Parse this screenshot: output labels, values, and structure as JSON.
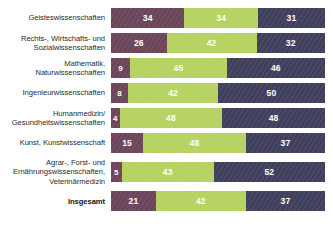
{
  "chart_data": {
    "type": "bar",
    "subtype": "stacked-horizontal-100pct",
    "title": "",
    "subtitle": "",
    "xlabel": "",
    "ylabel": "",
    "xlim": [
      0,
      100
    ],
    "grid": false,
    "legend_position": "none",
    "value_unit": "%",
    "categories": [
      "Geisteswissenschaften",
      "Rechts-, Wirtschafts- und\nSozialwissenschaften",
      "Mathematik,\nNaturwissenschaften",
      "Ingenieurwissenschaften",
      "Humanmedizin/\nGesundheitswissenschaften",
      "Kunst, Kunstwissenschaft",
      "Agrar-, Forst- und\nErnährungswissenschaften,\nVeterinärmedizin",
      "Insgesamt"
    ],
    "series": [
      {
        "name": "Segment 1",
        "color": "#6B4459",
        "values": [
          34,
          26,
          9,
          8,
          4,
          15,
          5,
          21
        ]
      },
      {
        "name": "Segment 2",
        "color": "#B5D25F",
        "values": [
          34,
          42,
          45,
          42,
          48,
          48,
          43,
          42
        ]
      },
      {
        "name": "Segment 3",
        "color": "#3E3E5C",
        "values": [
          31,
          32,
          46,
          50,
          48,
          37,
          52,
          37
        ]
      }
    ],
    "rows": [
      {
        "label": "Geisteswissenschaften",
        "total": false,
        "segments": [
          {
            "value": 34,
            "label": "34",
            "color": "#6B4459"
          },
          {
            "value": 34,
            "label": "34",
            "color": "#B5D25F"
          },
          {
            "value": 31,
            "label": "31",
            "color": "#3E3E5C"
          }
        ]
      },
      {
        "label": "Rechts-, Wirtschafts- und\nSozialwissenschaften",
        "total": false,
        "segments": [
          {
            "value": 26,
            "label": "26",
            "color": "#6B4459"
          },
          {
            "value": 42,
            "label": "42",
            "color": "#B5D25F"
          },
          {
            "value": 32,
            "label": "32",
            "color": "#3E3E5C"
          }
        ]
      },
      {
        "label": "Mathematik,\nNaturwissenschaften",
        "total": false,
        "segments": [
          {
            "value": 9,
            "label": "9",
            "color": "#6B4459"
          },
          {
            "value": 45,
            "label": "45",
            "color": "#B5D25F"
          },
          {
            "value": 46,
            "label": "46",
            "color": "#3E3E5C"
          }
        ]
      },
      {
        "label": "Ingenieurwissenschaften",
        "total": false,
        "segments": [
          {
            "value": 8,
            "label": "8",
            "color": "#6B4459"
          },
          {
            "value": 42,
            "label": "42",
            "color": "#B5D25F"
          },
          {
            "value": 50,
            "label": "50",
            "color": "#3E3E5C"
          }
        ]
      },
      {
        "label": "Humanmedizin/\nGesundheitswissenschaften",
        "total": false,
        "segments": [
          {
            "value": 4,
            "label": "4",
            "color": "#6B4459"
          },
          {
            "value": 48,
            "label": "48",
            "color": "#B5D25F"
          },
          {
            "value": 48,
            "label": "48",
            "color": "#3E3E5C"
          }
        ]
      },
      {
        "label": "Kunst, Kunstwissenschaft",
        "total": false,
        "segments": [
          {
            "value": 15,
            "label": "15",
            "color": "#6B4459"
          },
          {
            "value": 48,
            "label": "48",
            "color": "#B5D25F"
          },
          {
            "value": 37,
            "label": "37",
            "color": "#3E3E5C"
          }
        ]
      },
      {
        "label": "Agrar-, Forst- und\nErnährungswissenschaften,\nVeterinärmedizin",
        "total": false,
        "segments": [
          {
            "value": 5,
            "label": "5",
            "color": "#6B4459"
          },
          {
            "value": 43,
            "label": "43",
            "color": "#B5D25F"
          },
          {
            "value": 52,
            "label": "52",
            "color": "#3E3E5C"
          }
        ]
      },
      {
        "label": "Insgesamt",
        "total": true,
        "segments": [
          {
            "value": 21,
            "label": "21",
            "color": "#6B4459"
          },
          {
            "value": 42,
            "label": "42",
            "color": "#B5D25F"
          },
          {
            "value": 37,
            "label": "37",
            "color": "#3E3E5C"
          }
        ]
      }
    ]
  },
  "colors": {
    "segment_1": "#6B4459",
    "segment_2": "#B5D25F",
    "segment_3": "#3E3E5C",
    "background": "#ffffff",
    "label_text": "#2b2b2b",
    "value_text": "#ffffff"
  }
}
